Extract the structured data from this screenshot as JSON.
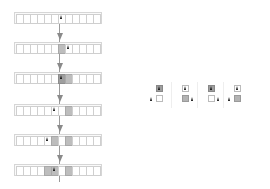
{
  "diagram": {
    "type": "turing-machine-evolution",
    "tape_cell_count": 12,
    "colors": {
      "empty": "#ffffff",
      "light_gray": "#bdbdbd",
      "dark_gray": "#9e9e9e",
      "head": "#111111",
      "arrow": "#8a8a8a",
      "border": "#cfcfcf"
    },
    "steps": [
      {
        "step": 0,
        "cells": [
          0,
          0,
          0,
          0,
          0,
          0,
          0,
          0,
          0,
          0,
          0,
          0
        ],
        "head": 6
      },
      {
        "step": 1,
        "cells": [
          0,
          0,
          0,
          0,
          0,
          0,
          1,
          0,
          0,
          0,
          0,
          0
        ],
        "head": 7
      },
      {
        "step": 2,
        "cells": [
          0,
          0,
          0,
          0,
          0,
          0,
          2,
          1,
          0,
          0,
          0,
          0
        ],
        "head": 6
      },
      {
        "step": 3,
        "cells": [
          0,
          0,
          0,
          0,
          0,
          0,
          0,
          1,
          0,
          0,
          0,
          0
        ],
        "head": 5
      },
      {
        "step": 4,
        "cells": [
          0,
          0,
          0,
          0,
          0,
          1,
          0,
          1,
          0,
          0,
          0,
          0
        ],
        "head": 4
      },
      {
        "step": 5,
        "cells": [
          0,
          0,
          0,
          0,
          1,
          1,
          0,
          1,
          0,
          0,
          0,
          0
        ],
        "head": 5
      }
    ],
    "rules": [
      {
        "top_cell": "dark",
        "bottom_cell": "white",
        "head_moves": "left"
      },
      {
        "top_cell": "white",
        "bottom_cell": "gray",
        "head_moves": "right"
      },
      {
        "top_cell": "dark",
        "bottom_cell": "white",
        "head_moves": "right"
      },
      {
        "top_cell": "white",
        "bottom_cell": "gray",
        "head_moves": "left"
      }
    ]
  }
}
